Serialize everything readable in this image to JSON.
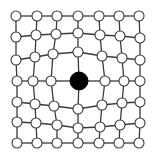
{
  "diagram": {
    "type": "deformed-grid-graph",
    "rows": 7,
    "cols": 7,
    "node_radius": 5,
    "center_node_radius": 9,
    "colors": {
      "edge": "#3a3a3a",
      "node_fill": "#ffffff",
      "node_stroke": "#3a3a3a",
      "center_fill": "#000000"
    },
    "center": {
      "row": 3,
      "col": 3
    },
    "nodes": [
      [
        [
          16,
          16
        ],
        [
          37,
          16
        ],
        [
          57,
          16
        ],
        [
          78,
          16
        ],
        [
          99,
          16
        ],
        [
          119,
          16
        ],
        [
          139,
          16
        ]
      ],
      [
        [
          16,
          37
        ],
        [
          36,
          35
        ],
        [
          56,
          34
        ],
        [
          78,
          33
        ],
        [
          100,
          35
        ],
        [
          120,
          36
        ],
        [
          140,
          38
        ]
      ],
      [
        [
          16,
          60
        ],
        [
          35,
          57
        ],
        [
          53,
          54
        ],
        [
          78,
          52
        ],
        [
          102,
          56
        ],
        [
          122,
          58
        ],
        [
          140,
          60
        ]
      ],
      [
        [
          17,
          81
        ],
        [
          33,
          81
        ],
        [
          51,
          81
        ],
        [
          79,
          81
        ],
        [
          105,
          81
        ],
        [
          124,
          81
        ],
        [
          140,
          81
        ]
      ],
      [
        [
          17,
          102
        ],
        [
          35,
          104
        ],
        [
          54,
          106
        ],
        [
          78,
          109
        ],
        [
          102,
          105
        ],
        [
          122,
          103
        ],
        [
          140,
          102
        ]
      ],
      [
        [
          17,
          122
        ],
        [
          36,
          123
        ],
        [
          57,
          125
        ],
        [
          78,
          128
        ],
        [
          100,
          127
        ],
        [
          120,
          125
        ],
        [
          140,
          123
        ]
      ],
      [
        [
          17,
          143
        ],
        [
          37,
          143
        ],
        [
          57,
          143
        ],
        [
          78,
          143
        ],
        [
          99,
          143
        ],
        [
          119,
          143
        ],
        [
          139,
          143
        ]
      ]
    ]
  }
}
